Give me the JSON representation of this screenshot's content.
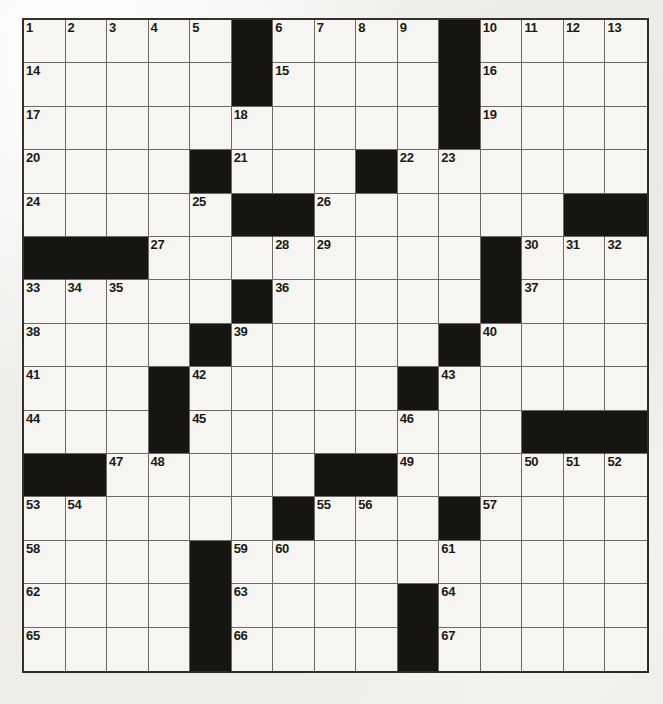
{
  "page": {
    "type": "crossword-puzzle-grid",
    "width": 663,
    "height": 704,
    "background_color": "#f2f1ee",
    "ink_color": "#1c1a17",
    "block_color": "#171512",
    "cell_fill_color": "#f6f5f1",
    "grid_line_color": "#6d6a63"
  },
  "grid": {
    "rows": 15,
    "cols": 15,
    "symmetry": "rotational",
    "numbered_clue_count": 67,
    "block_count": 37,
    "blocks": [
      [
        0,
        5
      ],
      [
        0,
        10
      ],
      [
        1,
        5
      ],
      [
        1,
        10
      ],
      [
        2,
        10
      ],
      [
        3,
        4
      ],
      [
        3,
        8
      ],
      [
        4,
        5
      ],
      [
        4,
        6
      ],
      [
        4,
        13
      ],
      [
        4,
        14
      ],
      [
        5,
        0
      ],
      [
        5,
        1
      ],
      [
        5,
        2
      ],
      [
        5,
        11
      ],
      [
        6,
        5
      ],
      [
        6,
        11
      ],
      [
        7,
        4
      ],
      [
        7,
        10
      ],
      [
        8,
        3
      ],
      [
        8,
        9
      ],
      [
        9,
        3
      ],
      [
        9,
        12
      ],
      [
        9,
        13
      ],
      [
        9,
        14
      ],
      [
        10,
        0
      ],
      [
        10,
        1
      ],
      [
        10,
        7
      ],
      [
        10,
        8
      ],
      [
        11,
        6
      ],
      [
        11,
        10
      ],
      [
        12,
        4
      ],
      [
        13,
        4
      ],
      [
        13,
        9
      ],
      [
        14,
        4
      ],
      [
        14,
        9
      ]
    ],
    "numbers": [
      {
        "n": 1,
        "row": 0,
        "col": 0
      },
      {
        "n": 2,
        "row": 0,
        "col": 1
      },
      {
        "n": 3,
        "row": 0,
        "col": 2
      },
      {
        "n": 4,
        "row": 0,
        "col": 3
      },
      {
        "n": 5,
        "row": 0,
        "col": 4
      },
      {
        "n": 6,
        "row": 0,
        "col": 6
      },
      {
        "n": 7,
        "row": 0,
        "col": 7
      },
      {
        "n": 8,
        "row": 0,
        "col": 8
      },
      {
        "n": 9,
        "row": 0,
        "col": 9
      },
      {
        "n": 10,
        "row": 0,
        "col": 11
      },
      {
        "n": 11,
        "row": 0,
        "col": 12
      },
      {
        "n": 12,
        "row": 0,
        "col": 13
      },
      {
        "n": 13,
        "row": 0,
        "col": 14
      },
      {
        "n": 14,
        "row": 1,
        "col": 0
      },
      {
        "n": 15,
        "row": 1,
        "col": 6
      },
      {
        "n": 16,
        "row": 1,
        "col": 11
      },
      {
        "n": 17,
        "row": 2,
        "col": 0
      },
      {
        "n": 18,
        "row": 2,
        "col": 5
      },
      {
        "n": 19,
        "row": 2,
        "col": 11
      },
      {
        "n": 20,
        "row": 3,
        "col": 0
      },
      {
        "n": 21,
        "row": 3,
        "col": 5
      },
      {
        "n": 22,
        "row": 3,
        "col": 9
      },
      {
        "n": 23,
        "row": 3,
        "col": 10
      },
      {
        "n": 24,
        "row": 4,
        "col": 0
      },
      {
        "n": 25,
        "row": 4,
        "col": 4
      },
      {
        "n": 26,
        "row": 4,
        "col": 7
      },
      {
        "n": 27,
        "row": 5,
        "col": 3
      },
      {
        "n": 28,
        "row": 5,
        "col": 6
      },
      {
        "n": 29,
        "row": 5,
        "col": 7
      },
      {
        "n": 30,
        "row": 5,
        "col": 12
      },
      {
        "n": 31,
        "row": 5,
        "col": 13
      },
      {
        "n": 32,
        "row": 5,
        "col": 14
      },
      {
        "n": 33,
        "row": 6,
        "col": 0
      },
      {
        "n": 34,
        "row": 6,
        "col": 1
      },
      {
        "n": 35,
        "row": 6,
        "col": 2
      },
      {
        "n": 36,
        "row": 6,
        "col": 6
      },
      {
        "n": 37,
        "row": 6,
        "col": 12
      },
      {
        "n": 38,
        "row": 7,
        "col": 0
      },
      {
        "n": 39,
        "row": 7,
        "col": 5
      },
      {
        "n": 40,
        "row": 7,
        "col": 11
      },
      {
        "n": 41,
        "row": 8,
        "col": 0
      },
      {
        "n": 42,
        "row": 8,
        "col": 4
      },
      {
        "n": 43,
        "row": 8,
        "col": 10
      },
      {
        "n": 44,
        "row": 9,
        "col": 0
      },
      {
        "n": 45,
        "row": 9,
        "col": 4
      },
      {
        "n": 46,
        "row": 9,
        "col": 9
      },
      {
        "n": 47,
        "row": 10,
        "col": 2
      },
      {
        "n": 48,
        "row": 10,
        "col": 3
      },
      {
        "n": 49,
        "row": 10,
        "col": 9
      },
      {
        "n": 50,
        "row": 10,
        "col": 12
      },
      {
        "n": 51,
        "row": 10,
        "col": 13
      },
      {
        "n": 52,
        "row": 10,
        "col": 14
      },
      {
        "n": 53,
        "row": 11,
        "col": 0
      },
      {
        "n": 54,
        "row": 11,
        "col": 1
      },
      {
        "n": 55,
        "row": 11,
        "col": 7
      },
      {
        "n": 56,
        "row": 11,
        "col": 8
      },
      {
        "n": 57,
        "row": 11,
        "col": 11
      },
      {
        "n": 58,
        "row": 12,
        "col": 0
      },
      {
        "n": 59,
        "row": 12,
        "col": 5
      },
      {
        "n": 60,
        "row": 12,
        "col": 6
      },
      {
        "n": 61,
        "row": 12,
        "col": 10
      },
      {
        "n": 62,
        "row": 13,
        "col": 0
      },
      {
        "n": 63,
        "row": 13,
        "col": 5
      },
      {
        "n": 64,
        "row": 13,
        "col": 10
      },
      {
        "n": 65,
        "row": 14,
        "col": 0
      },
      {
        "n": 66,
        "row": 14,
        "col": 5
      },
      {
        "n": 67,
        "row": 14,
        "col": 10
      }
    ],
    "entries": []
  }
}
